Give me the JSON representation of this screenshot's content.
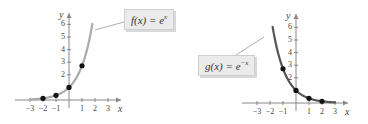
{
  "chart_data": [
    {
      "type": "line",
      "title": "f(x) = e^x",
      "function": "e^x",
      "label": {
        "text_main": "f(x) = e",
        "text_exp": "x"
      },
      "xlabel": "x",
      "ylabel": "y",
      "xlim": [
        -3.5,
        3.5
      ],
      "ylim": [
        -0.3,
        6.5
      ],
      "x_ticks": [
        -3,
        -2,
        -1,
        1,
        2,
        3
      ],
      "x_tick_labels": [
        "−3",
        "−2",
        "−1",
        "1",
        "2",
        "3"
      ],
      "y_ticks": [
        2,
        3,
        4,
        5,
        6
      ],
      "y_tick_labels": [
        "2",
        "3",
        "4",
        "5",
        "6"
      ],
      "points": [
        {
          "x": -2,
          "y": 0.135
        },
        {
          "x": -1,
          "y": 0.368
        },
        {
          "x": 0,
          "y": 1
        },
        {
          "x": 1,
          "y": 2.718
        }
      ],
      "curve_color": "#aaaaaa",
      "curve_domain": [
        -3,
        1.8
      ],
      "grid": false
    },
    {
      "type": "line",
      "title": "g(x) = e^-x",
      "function": "e^-x",
      "label": {
        "text_main": "g(x) = e",
        "text_exp": "−x"
      },
      "xlabel": "x",
      "ylabel": "y",
      "xlim": [
        -3.5,
        3.5
      ],
      "ylim": [
        -0.3,
        6.5
      ],
      "x_ticks": [
        -3,
        -2,
        -1,
        1,
        2,
        3
      ],
      "x_tick_labels": [
        "−3",
        "−2",
        "−1",
        "1",
        "2",
        "3"
      ],
      "y_ticks": [
        2,
        3,
        4,
        5,
        6
      ],
      "y_tick_labels": [
        "2",
        "3",
        "4",
        "5",
        "6"
      ],
      "points": [
        {
          "x": -1,
          "y": 2.718
        },
        {
          "x": 0,
          "y": 1
        },
        {
          "x": 1,
          "y": 0.368
        },
        {
          "x": 2,
          "y": 0.135
        }
      ],
      "curve_color": "#555555",
      "curve_domain": [
        -1.8,
        3
      ],
      "grid": false
    }
  ],
  "axis_color": "#888888",
  "point_color": "#111111"
}
